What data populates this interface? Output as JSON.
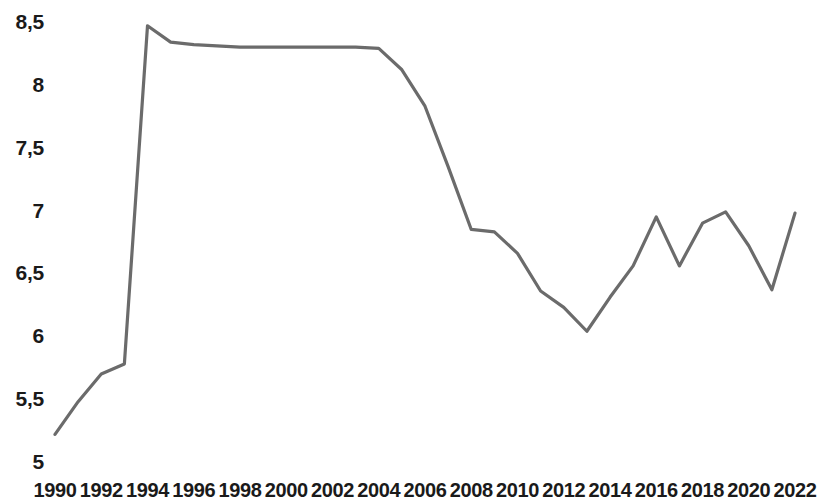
{
  "chart_data": {
    "type": "line",
    "title": "",
    "subtitle": "",
    "xlabel": "",
    "ylabel": "",
    "grid": false,
    "legend": null,
    "line_color": "#6b6b6b",
    "background_color": "#ffffff",
    "xlim": [
      1990,
      2022
    ],
    "ylim": [
      5,
      8.5
    ],
    "y_ticks": [
      "5",
      "5,5",
      "6",
      "6,5",
      "7",
      "7,5",
      "8",
      "8,5"
    ],
    "y_tick_values": [
      5,
      5.5,
      6,
      6.5,
      7,
      7.5,
      8,
      8.5
    ],
    "x_ticks": [
      "1990",
      "1992",
      "1994",
      "1996",
      "1998",
      "2000",
      "2002",
      "2004",
      "2006",
      "2008",
      "2010",
      "2012",
      "2014",
      "2016",
      "2018",
      "2020",
      "2022"
    ],
    "x_tick_values": [
      1990,
      1992,
      1994,
      1996,
      1998,
      2000,
      2002,
      2004,
      2006,
      2008,
      2010,
      2012,
      2014,
      2016,
      2018,
      2020,
      2022
    ],
    "x": [
      1990,
      1991,
      1992,
      1993,
      1994,
      1995,
      1996,
      1997,
      1998,
      1999,
      2000,
      2001,
      2002,
      2003,
      2004,
      2005,
      2006,
      2007,
      2008,
      2009,
      2010,
      2011,
      2012,
      2013,
      2014,
      2015,
      2016,
      2017,
      2018,
      2019,
      2020,
      2021,
      2022
    ],
    "values": [
      5.22,
      5.48,
      5.7,
      5.78,
      8.47,
      8.34,
      8.32,
      8.31,
      8.3,
      8.3,
      8.3,
      8.3,
      8.3,
      8.3,
      8.29,
      8.12,
      7.83,
      7.35,
      6.85,
      6.83,
      6.66,
      6.36,
      6.23,
      6.04,
      6.31,
      6.56,
      6.95,
      6.56,
      6.9,
      6.99,
      6.72,
      6.37,
      6.98
    ],
    "series": [
      {
        "name": "",
        "values": [
          5.22,
          5.48,
          5.7,
          5.78,
          8.47,
          8.34,
          8.32,
          8.31,
          8.3,
          8.3,
          8.3,
          8.3,
          8.3,
          8.3,
          8.29,
          8.12,
          7.83,
          7.35,
          6.85,
          6.83,
          6.66,
          6.36,
          6.23,
          6.04,
          6.31,
          6.56,
          6.95,
          6.56,
          6.9,
          6.99,
          6.72,
          6.37,
          6.98
        ]
      }
    ],
    "annotations": []
  }
}
